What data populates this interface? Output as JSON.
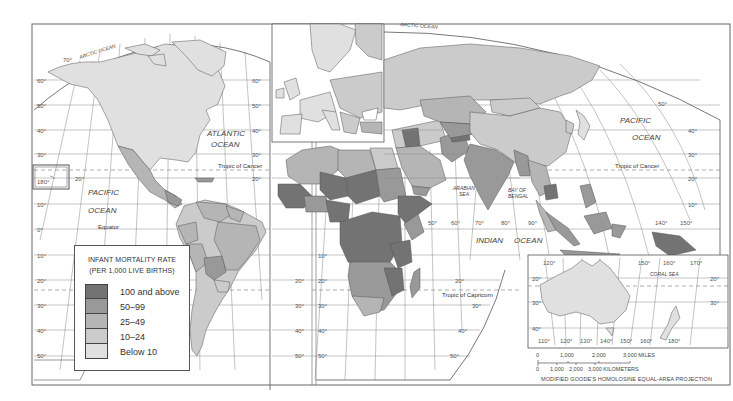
{
  "map": {
    "title": "Infant Mortality Rate World Map",
    "projection_note": "MODIFIED GOODE'S HOMOLOSINE EQUAL-AREA PROJECTION",
    "oceans": [
      {
        "name": "ARCTIC OCEAN",
        "region": "north-america-top"
      },
      {
        "name": "ATLANTIC OCEAN",
        "region": "north-atlantic"
      },
      {
        "name": "PACIFIC OCEAN",
        "region": "east-pacific"
      },
      {
        "name": "ARCTIC OCEAN",
        "region": "eurasia-top"
      },
      {
        "name": "PACIFIC OCEAN",
        "region": "west-pacific"
      },
      {
        "name": "INDIAN OCEAN",
        "region": "indian"
      }
    ],
    "seas": [
      "ARABIAN SEA",
      "BAY OF BENGAL",
      "CORAL SEA"
    ],
    "lines": {
      "tropic_cancer": "Tropic of Cancer",
      "tropic_capricorn": "Tropic of Capricorn",
      "equator": "Equator"
    },
    "labels": {
      "arctic_left": "ARCTIC OCEAN",
      "atlantic_1": "ATLANTIC",
      "atlantic_2": "OCEAN",
      "pacific_left_1": "PACIFIC",
      "pacific_left_2": "OCEAN",
      "arctic_right": "ARCTIC OCEAN",
      "pacific_right_1": "PACIFIC",
      "pacific_right_2": "OCEAN",
      "indian_1": "INDIAN",
      "indian_2": "OCEAN",
      "arabian_1": "ARABIAN",
      "arabian_2": "SEA",
      "bengal_1": "BAY OF",
      "bengal_2": "BENGAL",
      "coral": "CORAL  SEA",
      "tropic_cancer_left": "Tropic of Cancer",
      "tropic_cancer_right": "Tropic of Cancer",
      "tropic_capricorn": "Tropic of Capricorn",
      "equator": "Equator"
    },
    "latitude_ticks_left": [
      "70°",
      "60°",
      "50°",
      "40°",
      "30°",
      "20°",
      "10°",
      "0°",
      "10°",
      "20°",
      "30°",
      "40°",
      "50°"
    ],
    "longitude_ticks_bottom_inset": [
      "110°",
      "120°",
      "130°",
      "140°",
      "150°",
      "160°",
      "180°"
    ],
    "longitude_ticks_indian": [
      "50°",
      "60°",
      "70°",
      "80°",
      "90°",
      "140°",
      "150°"
    ],
    "inset_ticks_top": [
      "120°",
      "150°",
      "160°",
      "170°"
    ],
    "misc_ticks": {
      "pacific_180": "180°"
    }
  },
  "legend": {
    "title_line1": "INFANT MORTALITY RATE",
    "title_line2": "(PER 1,000 LIVE BIRTHS)",
    "items": [
      {
        "label": "100 and above",
        "color": "#737373"
      },
      {
        "label": "50–99",
        "color": "#999999"
      },
      {
        "label": "25–49",
        "color": "#b5b5b5"
      },
      {
        "label": "10–24",
        "color": "#cbcbcb"
      },
      {
        "label": "Below 10",
        "color": "#e0e0e0"
      }
    ]
  },
  "scale_bar": {
    "miles_ticks": [
      "0",
      "1,000",
      "2,000",
      "3,000 MILES"
    ],
    "km_ticks": [
      "0",
      "1,000",
      "2,000",
      "3,000 KILOMETERS"
    ]
  },
  "colors": {
    "c100": "#737373",
    "c50": "#999999",
    "c25": "#b5b5b5",
    "c10": "#cbcbcb",
    "c0": "#e0e0e0",
    "ocean": "#ffffff",
    "border": "#555555"
  }
}
